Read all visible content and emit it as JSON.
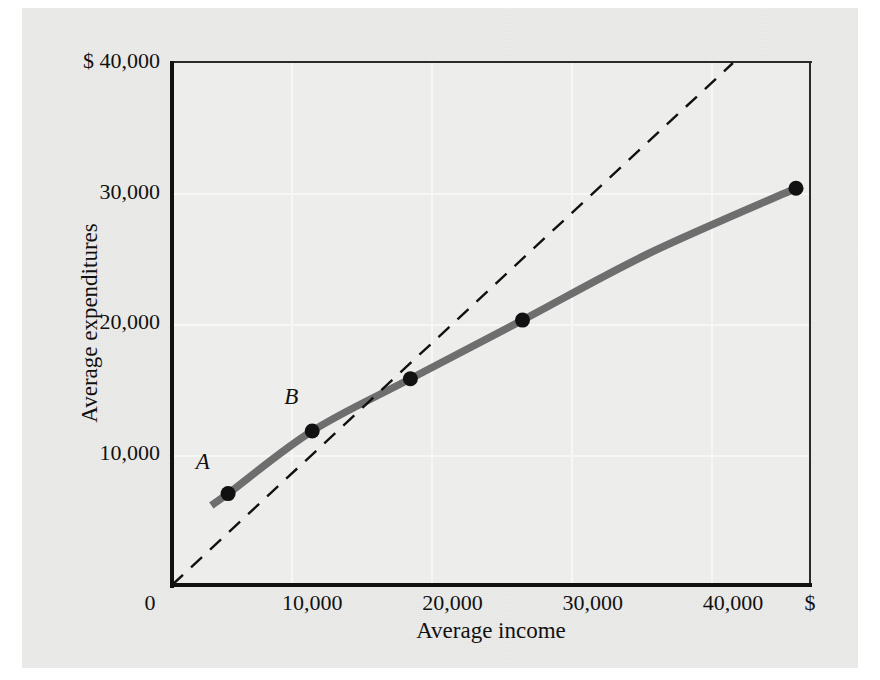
{
  "figure": {
    "background_color": "#ececeb",
    "plot_background_color": "#ededec",
    "grid_color": "#f7f7f6",
    "axis_color": "#111111",
    "curve_color": "#6e6e6e",
    "reference_line_color": "#111111",
    "point_color": "#111111"
  },
  "chart_data": {
    "type": "line",
    "title": "",
    "xlabel": "Average income",
    "ylabel": "Average expenditures",
    "xlim": [
      0,
      45500
    ],
    "ylim": [
      0,
      40000
    ],
    "grid": true,
    "legend": "none",
    "x_currency_symbol": "$",
    "y_currency_symbol": "$",
    "x_ticks": [
      {
        "value": 0,
        "label": "0"
      },
      {
        "value": 10000,
        "label": "10,000"
      },
      {
        "value": 20000,
        "label": "20,000"
      },
      {
        "value": 30000,
        "label": "30,000"
      },
      {
        "value": 40000,
        "label": "40,000"
      },
      {
        "value": 45500,
        "label": "$"
      }
    ],
    "y_ticks": [
      {
        "value": 10000,
        "label": "10,000"
      },
      {
        "value": 20000,
        "label": "20,000"
      },
      {
        "value": 30000,
        "label": "30,000"
      },
      {
        "value": 40000,
        "label": "$ 40,000"
      }
    ],
    "series": [
      {
        "name": "Consumption function",
        "style": "solid",
        "color": "#6e6e6e",
        "x": [
          2800,
          4000,
          10000,
          17000,
          25000,
          34000,
          44500
        ],
        "y": [
          6100,
          7000,
          11800,
          15800,
          20300,
          25400,
          30400
        ]
      },
      {
        "name": "45-degree line",
        "style": "dashed",
        "color": "#111111",
        "x": [
          0,
          40000
        ],
        "y": [
          0,
          40000
        ]
      }
    ],
    "markers": [
      {
        "label": "A",
        "x": 4000,
        "y": 7000,
        "label_dx": -1800,
        "label_dy": 2400
      },
      {
        "label": "B",
        "x": 10000,
        "y": 11800,
        "label_dx": -1500,
        "label_dy": 2600
      },
      {
        "label": "",
        "x": 17000,
        "y": 15800,
        "label_dx": 0,
        "label_dy": 0
      },
      {
        "label": "",
        "x": 25000,
        "y": 20300,
        "label_dx": 0,
        "label_dy": 0
      },
      {
        "label": "",
        "x": 44500,
        "y": 30400,
        "label_dx": 0,
        "label_dy": 0
      }
    ],
    "annotations": []
  }
}
